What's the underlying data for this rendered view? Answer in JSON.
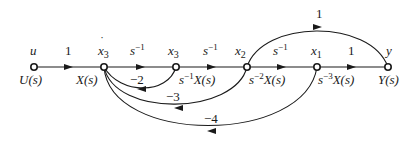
{
  "diagram": {
    "type": "signal-flow-graph",
    "nodes": [
      {
        "id": "u",
        "top": "u",
        "bottom": "U(s)",
        "x": 34,
        "y": 67
      },
      {
        "id": "x3dot",
        "top": "ẋ3",
        "bottom": "X(s)",
        "x": 104,
        "y": 67
      },
      {
        "id": "x3",
        "top": "x3",
        "bottom": "s⁻¹X(s)",
        "x": 176,
        "y": 67
      },
      {
        "id": "x2",
        "top": "x2",
        "bottom": "s⁻²X(s)",
        "x": 247,
        "y": 67
      },
      {
        "id": "x1",
        "top": "x1",
        "bottom": "s⁻³X(s)",
        "x": 317,
        "y": 67
      },
      {
        "id": "y",
        "top": "y",
        "bottom": "Y(s)",
        "x": 388,
        "y": 67
      }
    ],
    "forward_edges": [
      {
        "from": "u",
        "to": "x3dot",
        "gain": "1"
      },
      {
        "from": "x3dot",
        "to": "x3",
        "gain": "s⁻¹"
      },
      {
        "from": "x3",
        "to": "x2",
        "gain": "s⁻¹"
      },
      {
        "from": "x2",
        "to": "x1",
        "gain": "s⁻¹"
      },
      {
        "from": "x1",
        "to": "y",
        "gain": "1"
      }
    ],
    "feedforward_edges": [
      {
        "from": "x2",
        "to": "y",
        "gain": "1"
      }
    ],
    "feedback_edges": [
      {
        "from": "x3",
        "to": "x3dot",
        "gain": "−2"
      },
      {
        "from": "x2",
        "to": "x3dot",
        "gain": "−3"
      },
      {
        "from": "x1",
        "to": "x3dot",
        "gain": "−4"
      }
    ]
  },
  "labels": {
    "u_top": "u",
    "u_bot": "U(s)",
    "xd_top_base": "x",
    "xd_top_sub": "3",
    "xd_bot": "X(s)",
    "x3_top_base": "x",
    "x3_top_sub": "3",
    "x3_bot_pre": "s",
    "x3_bot_exp": "−1",
    "x3_bot_post": "X(s)",
    "x2_top_base": "x",
    "x2_top_sub": "2",
    "x2_bot_pre": "s",
    "x2_bot_exp": "−2",
    "x2_bot_post": "X(s)",
    "x1_top_base": "x",
    "x1_top_sub": "1",
    "x1_bot_pre": "s",
    "x1_bot_exp": "−3",
    "x1_bot_post": "X(s)",
    "y_top": "y",
    "y_bot": "Y(s)",
    "g_u_x": "1",
    "g_s1_base": "s",
    "g_s1_exp": "−1",
    "g_s2_base": "s",
    "g_s2_exp": "−1",
    "g_s3_base": "s",
    "g_s3_exp": "−1",
    "g_x1_y": "1",
    "g_ff": "1",
    "g_fb2": "−2",
    "g_fb3": "−3",
    "g_fb4": "−4"
  }
}
